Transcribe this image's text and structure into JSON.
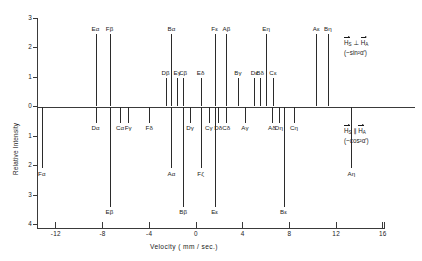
{
  "chart_data": {
    "type": "bar",
    "title": "",
    "xlabel": "Velocity ( mm / sec.)",
    "ylabel": "Relative Intensity",
    "xlim": [
      -14.5,
      16.5
    ],
    "ylim": [
      -4,
      3
    ],
    "xticks": [
      -12,
      -8,
      -4,
      0,
      4,
      8,
      12,
      16
    ],
    "xtick_labels": [
      "-12",
      "-8",
      "-4",
      "0",
      "4",
      "8",
      "12",
      "16"
    ],
    "yticks": [
      3,
      2,
      1,
      0,
      1,
      2,
      3,
      4
    ],
    "ytick_labels": [
      "3",
      "2",
      "1",
      "0",
      "1",
      "2",
      "3",
      "4"
    ],
    "grid": false,
    "legend": "none",
    "note": "Stick spectrum: upward sticks = H_S perpendicular H_A branch; downward sticks = H_S parallel H_A branch",
    "series": [
      {
        "name": "H_S perpendicular H_A (~ sin^2 alpha')",
        "direction": "up",
        "points": [
          {
            "label": "Eα",
            "x": -8.6,
            "y": 2.45
          },
          {
            "label": "Fβ",
            "x": -7.4,
            "y": 2.45
          },
          {
            "label": "Dβ",
            "x": -2.6,
            "y": 0.95
          },
          {
            "label": "Bα",
            "x": -2.1,
            "y": 2.45
          },
          {
            "label": "Eγ",
            "x": -1.6,
            "y": 0.95
          },
          {
            "label": "Cβ",
            "x": -1.1,
            "y": 0.95
          },
          {
            "label": "Eδ",
            "x": 0.4,
            "y": 0.95
          },
          {
            "label": "Fε",
            "x": 1.6,
            "y": 2.45
          },
          {
            "label": "Aβ",
            "x": 2.6,
            "y": 2.45
          },
          {
            "label": "Bγ",
            "x": 3.6,
            "y": 0.95
          },
          {
            "label": "Dε",
            "x": 5.0,
            "y": 0.95
          },
          {
            "label": "Bδ",
            "x": 5.5,
            "y": 0.95
          },
          {
            "label": "Eη",
            "x": 6.0,
            "y": 2.45
          },
          {
            "label": "Cε",
            "x": 6.6,
            "y": 0.95
          },
          {
            "label": "Aε",
            "x": 10.3,
            "y": 2.45
          },
          {
            "label": "Bη",
            "x": 11.3,
            "y": 2.45
          }
        ]
      },
      {
        "name": "H_S parallel H_A (~ cos^2 alpha')",
        "direction": "down",
        "points": [
          {
            "label": "Fα",
            "x": -13.2,
            "y": -2.1
          },
          {
            "label": "Dα",
            "x": -8.6,
            "y": -0.55
          },
          {
            "label": "Eβ",
            "x": -7.4,
            "y": -3.4
          },
          {
            "label": "Cα",
            "x": -6.5,
            "y": -0.55
          },
          {
            "label": "Fγ",
            "x": -5.8,
            "y": -0.55
          },
          {
            "label": "Fδ",
            "x": -4.0,
            "y": -0.55
          },
          {
            "label": "Aα",
            "x": -2.1,
            "y": -2.1
          },
          {
            "label": "Bβ",
            "x": -1.1,
            "y": -3.4
          },
          {
            "label": "Dγ",
            "x": -0.5,
            "y": -0.55
          },
          {
            "label": "Cγ",
            "x": 1.1,
            "y": -0.55
          },
          {
            "label": "Dδ",
            "x": 1.9,
            "y": -0.55
          },
          {
            "label": "Cδ",
            "x": 2.6,
            "y": -0.55
          },
          {
            "label": "Eε",
            "x": 1.6,
            "y": -3.4
          },
          {
            "label": "Fζ",
            "x": 0.4,
            "y": -2.1
          },
          {
            "label": "Aγ",
            "x": 4.2,
            "y": -0.55
          },
          {
            "label": "Aδ",
            "x": 6.5,
            "y": -0.55
          },
          {
            "label": "Dη",
            "x": 7.1,
            "y": -0.55
          },
          {
            "label": "Bε",
            "x": 7.5,
            "y": -3.4
          },
          {
            "label": "Cη",
            "x": 8.4,
            "y": -0.55
          },
          {
            "label": "Aη",
            "x": 13.3,
            "y": -2.1
          }
        ]
      }
    ]
  },
  "annotations": {
    "perp": {
      "line1_h_s": "H",
      "line1_sub_s": "S",
      "line1_op": "⊥",
      "line1_h_a": "H",
      "line1_sub_a": "A",
      "line2": "(~sin²α′)"
    },
    "para": {
      "line1_h_s": "H",
      "line1_sub_s": "S",
      "line1_op": "∥",
      "line1_h_a": "H",
      "line1_sub_a": "A",
      "line2": "(~cos²α′)"
    }
  }
}
